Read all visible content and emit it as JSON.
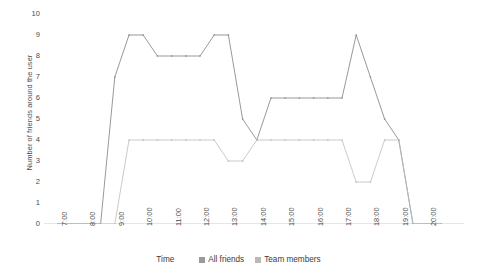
{
  "chart_data": {
    "type": "line",
    "title": "",
    "xlabel": "Time",
    "ylabel": "Number of friends around the user",
    "ylim": [
      0,
      10
    ],
    "y_ticks": [
      0,
      1,
      2,
      3,
      4,
      5,
      6,
      7,
      8,
      9,
      10
    ],
    "grid": false,
    "legend_position": "bottom",
    "x_tick_labels": [
      "7:00",
      "8:00",
      "9:00",
      "10:00",
      "11:00",
      "12:00",
      "13:00",
      "14:00",
      "15:00",
      "16:00",
      "17:00",
      "18:00",
      "19:00",
      "20:00"
    ],
    "x": [
      "7:00",
      "7:30",
      "8:00",
      "8:30",
      "9:00",
      "9:30",
      "10:00",
      "10:30",
      "11:00",
      "11:30",
      "12:00",
      "12:30",
      "13:00",
      "13:30",
      "14:00",
      "14:30",
      "15:00",
      "15:30",
      "16:00",
      "16:30",
      "17:00",
      "17:30",
      "18:00",
      "18:30",
      "19:00",
      "19:30",
      "20:00",
      "20:30"
    ],
    "series": [
      {
        "name": "All friends",
        "color": "#8d8d8d",
        "values": [
          0,
          0,
          0,
          0,
          7,
          9,
          9,
          8,
          8,
          8,
          8,
          9,
          9,
          5,
          4,
          6,
          6,
          6,
          6,
          6,
          6,
          9,
          7,
          5,
          4,
          0,
          0,
          0
        ]
      },
      {
        "name": "Team members",
        "color": "#bdbdbd",
        "values": [
          0,
          0,
          0,
          0,
          0,
          4,
          4,
          4,
          4,
          4,
          4,
          4,
          3,
          3,
          4,
          4,
          4,
          4,
          4,
          4,
          4,
          2,
          2,
          4,
          4,
          0,
          0,
          0
        ]
      }
    ]
  },
  "axes": {
    "y_title": "Number of friends around the user",
    "x_title": "Time"
  },
  "legend": {
    "x_title": "Time",
    "items": [
      {
        "label": "All friends",
        "swatch": "legend-swatch-all-friends"
      },
      {
        "label": "Team members",
        "swatch": "legend-swatch-team-members"
      }
    ]
  },
  "colors": {
    "all_friends": "#8d8d8d",
    "team_members": "#bdbdbd",
    "axis": "#bfbfbf",
    "text": "#4c4c4c"
  }
}
